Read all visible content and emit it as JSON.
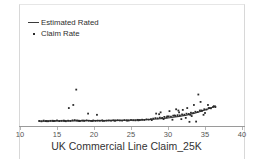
{
  "legend": {
    "position": "top-left",
    "entries": [
      {
        "label": "Estimated Rated",
        "marker": "line",
        "name": "legend-item-estimated-rated"
      },
      {
        "label": "Claim Rate",
        "marker": "dot",
        "name": "legend-item-claim-rate"
      }
    ]
  },
  "axis": {
    "x_title": "UK Commercial Line Claim_25K",
    "tick_labels": [
      "10",
      "15",
      "20",
      "25",
      "30",
      "35",
      "40"
    ]
  },
  "colors": {
    "point": "#2b2b2b",
    "line": "#3a3a3a",
    "axis": "#9a9a9a",
    "frame": "#d8d8d8",
    "text": "#333333",
    "background": "#ffffff"
  },
  "chart_data": {
    "type": "scatter",
    "title": "",
    "subtitle": "",
    "xlabel": "UK Commercial Line Claim_25K",
    "ylabel": "",
    "xlim": [
      10,
      40
    ],
    "ylim": [
      0,
      1
    ],
    "xticks": [
      10,
      15,
      20,
      25,
      30,
      35,
      40
    ],
    "yticks": [],
    "grid": false,
    "legend_position": "top-left",
    "series": [
      {
        "name": "Claim Rate",
        "type": "scatter",
        "marker": "square-dot",
        "color": "#2b2b2b",
        "x": [
          12.6,
          12.9,
          13.2,
          13.5,
          13.8,
          14.1,
          14.4,
          14.7,
          15.0,
          15.3,
          15.6,
          15.9,
          16.2,
          16.5,
          16.8,
          17.1,
          17.4,
          17.7,
          17.9,
          18.0,
          18.1,
          18.4,
          18.7,
          19.0,
          19.3,
          19.6,
          19.9,
          20.2,
          20.5,
          20.8,
          21.1,
          21.4,
          21.7,
          22.0,
          22.3,
          22.6,
          22.9,
          23.2,
          23.5,
          23.8,
          24.1,
          24.4,
          24.7,
          25.0,
          25.3,
          25.6,
          25.9,
          26.2,
          26.5,
          26.8,
          27.1,
          27.4,
          27.7,
          28.0,
          28.3,
          28.6,
          28.9,
          29.2,
          29.5,
          29.8,
          30.1,
          30.4,
          30.7,
          31.0,
          31.3,
          31.6,
          31.9,
          32.2,
          32.5,
          32.8,
          33.1,
          33.4,
          33.7,
          34.0,
          34.3,
          34.6,
          34.9,
          35.2,
          35.5,
          35.8,
          36.1,
          36.4,
          17.6,
          17.2,
          16.6,
          19.2,
          20.4,
          28.4,
          29.0,
          30.2,
          31.1,
          31.5,
          32.0,
          32.6,
          33.0,
          33.5,
          34.1,
          34.5,
          35.0,
          35.6,
          36.2,
          31.8,
          32.4,
          33.2,
          34.8,
          30.6,
          29.4,
          27.8,
          26.0,
          24.5,
          22.8,
          21.2,
          19.8,
          18.6,
          16.0,
          14.5,
          13.6,
          33.8,
          32.9,
          31.4,
          30.9,
          29.9,
          28.8,
          35.4,
          34.4
        ],
        "y": [
          0.045,
          0.042,
          0.048,
          0.044,
          0.043,
          0.046,
          0.047,
          0.045,
          0.049,
          0.044,
          0.046,
          0.048,
          0.043,
          0.047,
          0.045,
          0.05,
          0.052,
          0.049,
          0.047,
          0.046,
          0.044,
          0.048,
          0.046,
          0.05,
          0.047,
          0.045,
          0.049,
          0.046,
          0.048,
          0.047,
          0.05,
          0.046,
          0.048,
          0.049,
          0.047,
          0.05,
          0.048,
          0.051,
          0.049,
          0.048,
          0.052,
          0.05,
          0.049,
          0.053,
          0.051,
          0.05,
          0.054,
          0.052,
          0.055,
          0.053,
          0.058,
          0.056,
          0.06,
          0.064,
          0.068,
          0.066,
          0.072,
          0.07,
          0.078,
          0.074,
          0.082,
          0.08,
          0.088,
          0.086,
          0.092,
          0.09,
          0.098,
          0.096,
          0.104,
          0.102,
          0.112,
          0.11,
          0.12,
          0.118,
          0.13,
          0.128,
          0.14,
          0.138,
          0.15,
          0.148,
          0.16,
          0.158,
          0.3,
          0.175,
          0.15,
          0.105,
          0.095,
          0.105,
          0.115,
          0.125,
          0.14,
          0.115,
          0.135,
          0.15,
          0.095,
          0.175,
          0.26,
          0.13,
          0.11,
          0.15,
          0.165,
          0.06,
          0.07,
          0.085,
          0.095,
          0.055,
          0.06,
          0.052,
          0.05,
          0.048,
          0.047,
          0.046,
          0.045,
          0.048,
          0.046,
          0.044,
          0.043,
          0.04,
          0.038,
          0.13,
          0.09,
          0.082,
          0.1,
          0.175,
          0.2
        ]
      },
      {
        "name": "Estimated Rated",
        "type": "line",
        "color": "#3a3a3a",
        "x": [
          12.5,
          13.5,
          14.5,
          15.5,
          16.5,
          17.5,
          18.5,
          19.5,
          20.5,
          21.5,
          22.5,
          23.5,
          24.5,
          25.5,
          26.5,
          27.5,
          28.5,
          29.5,
          30.5,
          31.5,
          32.5,
          33.5,
          34.5,
          35.5,
          36.5
        ],
        "y": [
          0.044,
          0.044,
          0.045,
          0.045,
          0.046,
          0.046,
          0.047,
          0.047,
          0.048,
          0.048,
          0.049,
          0.05,
          0.051,
          0.052,
          0.054,
          0.057,
          0.061,
          0.066,
          0.073,
          0.082,
          0.093,
          0.107,
          0.124,
          0.144,
          0.168
        ]
      }
    ]
  }
}
